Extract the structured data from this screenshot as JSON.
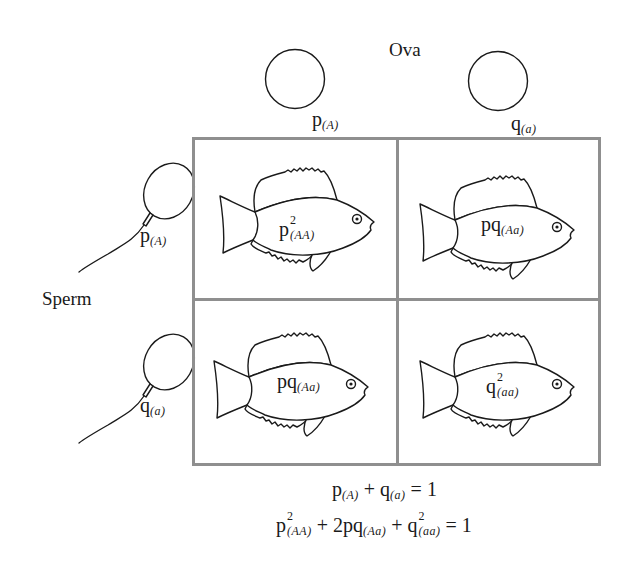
{
  "diagram": {
    "type": "punnett-square",
    "ova": {
      "title": "Ova",
      "gametes": [
        {
          "symbol": "p",
          "allele": "(A)"
        },
        {
          "symbol": "q",
          "allele": "(a)"
        }
      ]
    },
    "sperm": {
      "title": "Sperm",
      "gametes": [
        {
          "symbol": "p",
          "allele": "(A)"
        },
        {
          "symbol": "q",
          "allele": "(a)"
        }
      ]
    },
    "cells": [
      {
        "freq": "p",
        "exp": "2",
        "genotype": "(AA)"
      },
      {
        "freq": "pq",
        "exp": "",
        "genotype": "(Aa)"
      },
      {
        "freq": "pq",
        "exp": "",
        "genotype": "(Aa)"
      },
      {
        "freq": "q",
        "exp": "2",
        "genotype": "(aa)"
      }
    ],
    "equations": {
      "eq1": {
        "t1": "p",
        "s1": "(A)",
        "op1": " + ",
        "t2": "q",
        "s2": "(a)",
        "rhs": " = 1"
      },
      "eq2": {
        "t1": "p",
        "e1": "2",
        "s1": "(AA)",
        "op1": " + ",
        "t2": "2pq",
        "s2": "(Aa)",
        "op2": " + ",
        "t3": "q",
        "e3": "2",
        "s3": "(aa)",
        "rhs": " = 1"
      }
    },
    "colors": {
      "line": "#1a1a1a",
      "grid_border": "#8f8f8f",
      "background": "#ffffff"
    }
  }
}
